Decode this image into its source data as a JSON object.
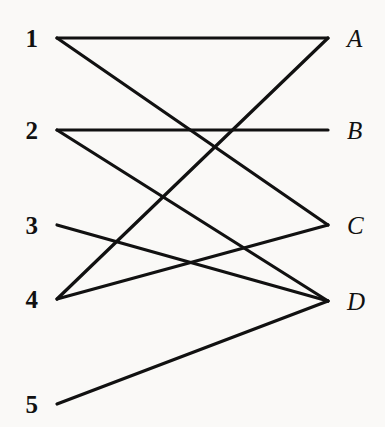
{
  "diagram": {
    "type": "bipartite-graph",
    "title": "",
    "background_color": "#faf9f7",
    "edge_color": "#111111",
    "label_color": "#111111",
    "edge_width": 3.2,
    "canvas": {
      "width": 385,
      "height": 427
    },
    "left_nodes": [
      {
        "id": "1",
        "label": "1",
        "x": 44,
        "y": 38
      },
      {
        "id": "2",
        "label": "2",
        "x": 44,
        "y": 130
      },
      {
        "id": "3",
        "label": "3",
        "x": 44,
        "y": 225
      },
      {
        "id": "4",
        "label": "4",
        "x": 44,
        "y": 299
      },
      {
        "id": "5",
        "label": "5",
        "x": 44,
        "y": 404
      }
    ],
    "right_nodes": [
      {
        "id": "A",
        "label": "A",
        "x": 341,
        "y": 38
      },
      {
        "id": "B",
        "label": "B",
        "x": 341,
        "y": 130
      },
      {
        "id": "C",
        "label": "C",
        "x": 341,
        "y": 225
      },
      {
        "id": "D",
        "label": "D",
        "x": 341,
        "y": 301
      }
    ],
    "edges": [
      {
        "from": "1",
        "to": "A"
      },
      {
        "from": "1",
        "to": "C"
      },
      {
        "from": "2",
        "to": "B"
      },
      {
        "from": "2",
        "to": "D"
      },
      {
        "from": "3",
        "to": "D"
      },
      {
        "from": "4",
        "to": "A"
      },
      {
        "from": "4",
        "to": "C"
      },
      {
        "from": "5",
        "to": "D"
      }
    ]
  }
}
